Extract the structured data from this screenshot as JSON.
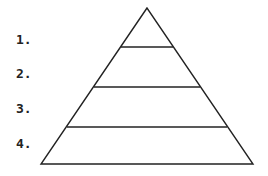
{
  "diagram": {
    "type": "pyramid",
    "levels": [
      {
        "label": "1."
      },
      {
        "label": "2."
      },
      {
        "label": "3."
      },
      {
        "label": "4."
      }
    ],
    "stroke_color": "#222222",
    "background": "#ffffff"
  }
}
